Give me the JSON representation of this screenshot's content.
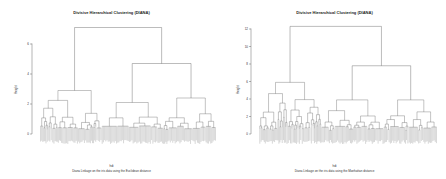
{
  "chart_data": [
    {
      "type": "dendrogram",
      "title": "Divisive Hierarchical Clustering (DIANA)",
      "xlabel": "hdi",
      "subtitle": "Diana Linkage on the iris data using the Euclidean distance",
      "ylabel": "Height",
      "yticks": [
        0,
        2,
        4,
        6
      ],
      "ylim": [
        0,
        7.2
      ],
      "top_merge_height": 7.1,
      "second_merge_height": 4.7,
      "main_clusters": 3,
      "leaves": 150
    },
    {
      "type": "dendrogram",
      "title": "Divisive Hierarchical Clustering (DIANA)",
      "xlabel": "hdi",
      "subtitle": "Diana Linkage on the iris data using the Manhattan distance",
      "ylabel": "Height",
      "yticks": [
        0,
        2,
        4,
        6,
        8,
        10,
        12
      ],
      "ylim": [
        0,
        12.5
      ],
      "top_merge_height": 12.3,
      "second_merge_height": 7.8,
      "main_clusters": 3,
      "leaves": 150
    }
  ],
  "panels": [
    {
      "title": "Divisive Hierarchical Clustering (DIANA)",
      "xlabel": "hdi",
      "subtitle": "Diana Linkage on the iris data using the Euclidean distance",
      "ylabel": "Height",
      "tick_labels": [
        "6",
        "4",
        "2",
        "0"
      ]
    },
    {
      "title": "Divisive Hierarchical Clustering (DIANA)",
      "xlabel": "hdi",
      "subtitle": "Diana Linkage on the iris data using the Manhattan distance",
      "ylabel": "Height",
      "tick_labels": [
        "12",
        "10",
        "8",
        "6",
        "4",
        "2",
        "0"
      ]
    }
  ],
  "colors": {
    "line": "#555555",
    "leaf": "#777777"
  }
}
